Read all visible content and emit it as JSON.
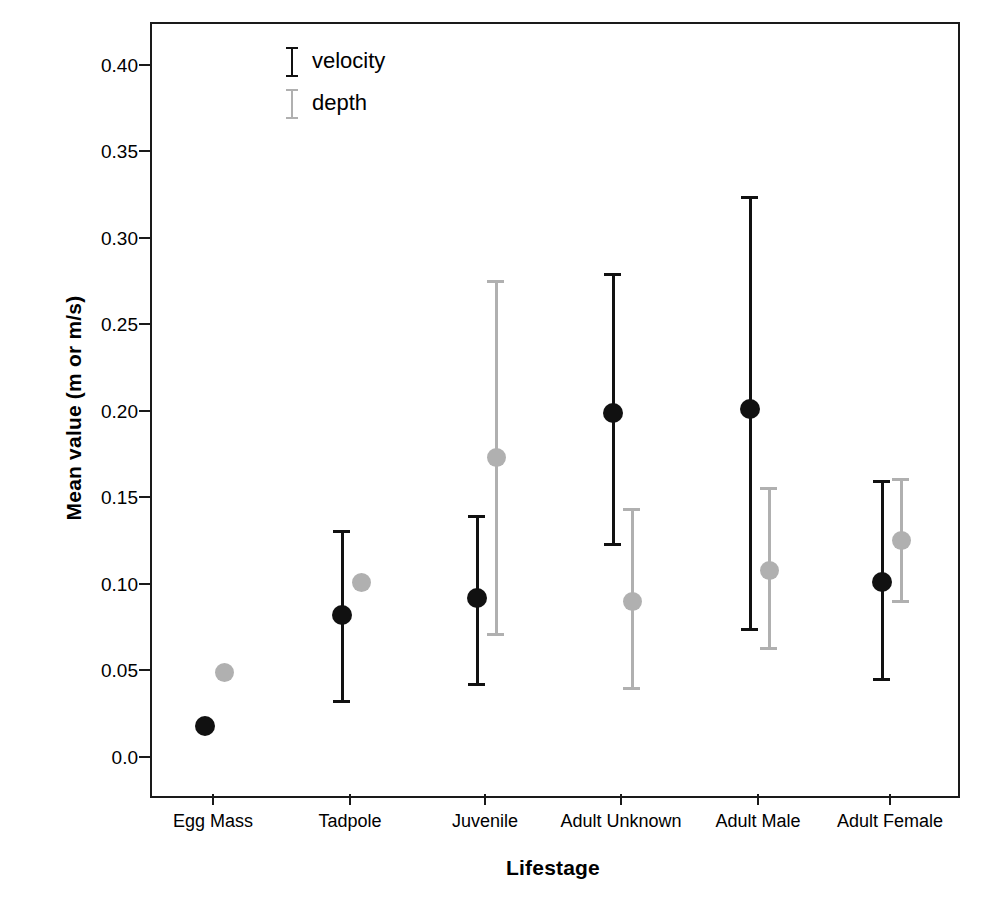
{
  "chart_data": {
    "type": "scatter",
    "title": "",
    "subtitle": "",
    "xlabel": "Lifestage",
    "ylabel": "Mean value (m or m/s)",
    "grid": false,
    "legend_position": "top-left-inside",
    "categories": [
      "Egg Mass",
      "Tadpole",
      "Juvenile",
      "Adult Unknown",
      "Adult Male",
      "Adult Female"
    ],
    "ylim": [
      0.0,
      0.425
    ],
    "yticks": [
      "0.0",
      "0.05",
      "0.10",
      "0.15",
      "0.20",
      "0.25",
      "0.30",
      "0.35",
      "0.40"
    ],
    "ytick_values": [
      0.0,
      0.05,
      0.1,
      0.15,
      0.2,
      0.25,
      0.3,
      0.35,
      0.4
    ],
    "series": [
      {
        "name": "velocity",
        "color": "#111111",
        "values": [
          0.018,
          0.082,
          0.092,
          0.199,
          0.201,
          0.101
        ],
        "error_low": [
          null,
          0.031,
          0.041,
          0.122,
          0.073,
          0.044
        ],
        "error_high": [
          null,
          0.131,
          0.14,
          0.28,
          0.324,
          0.16
        ]
      },
      {
        "name": "depth",
        "color": "#b0b0b0",
        "values": [
          0.049,
          0.101,
          0.173,
          0.09,
          0.108,
          0.125
        ],
        "error_low": [
          null,
          null,
          0.07,
          0.039,
          0.062,
          0.089
        ],
        "error_high": [
          null,
          null,
          0.276,
          0.144,
          0.156,
          0.161
        ]
      }
    ]
  },
  "axes": {
    "ylabel": "Mean value (m or m/s)",
    "xlabel": "Lifestage",
    "ytick_labels": [
      "0.40",
      "0.35",
      "0.30",
      "0.25",
      "0.20",
      "0.15",
      "0.10",
      "0.05",
      "0.0"
    ],
    "xtick_labels": [
      "Egg Mass",
      "Tadpole",
      "Juvenile",
      "Adult Unknown",
      "Adult Male",
      "Adult Female"
    ]
  },
  "legend": {
    "items": [
      {
        "label": "velocity",
        "color": "#111111"
      },
      {
        "label": "depth",
        "color": "#b0b0b0"
      }
    ]
  }
}
